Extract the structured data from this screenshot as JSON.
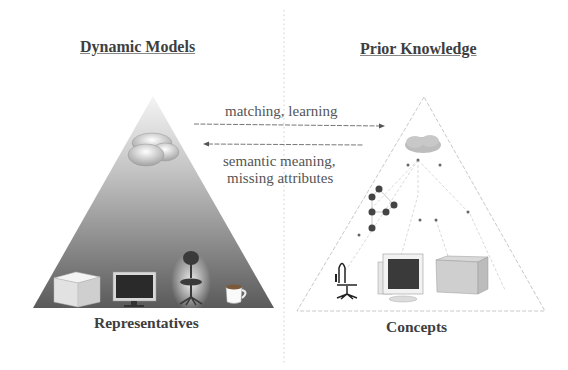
{
  "left_panel": {
    "title": "Dynamic Models",
    "caption": "Representatives",
    "objects": [
      "box-icon",
      "monitor-icon",
      "chair-icon",
      "cup-icon"
    ],
    "gradient_top": "#f2f2f2",
    "gradient_bottom": "#555555"
  },
  "right_panel": {
    "title": "Prior Knowledge",
    "caption": "Concepts",
    "objects": [
      "chair-icon",
      "crt-monitor-icon",
      "box-icon"
    ]
  },
  "arrows": {
    "forward_label": "matching, learning",
    "backward_label_line1": "semantic meaning,",
    "backward_label_line2": "missing attributes"
  },
  "colors": {
    "text": "#3e3e3e",
    "dotted_line": "#bbbbbb",
    "arrow": "#666666"
  }
}
